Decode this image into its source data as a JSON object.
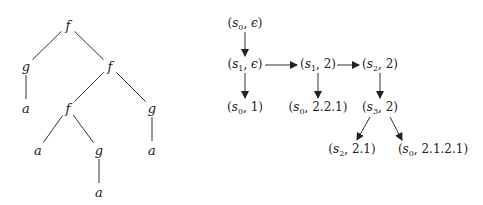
{
  "tree": {
    "nodes": [
      {
        "id": "n0",
        "label": "f",
        "x": 68,
        "y": 25
      },
      {
        "id": "n1",
        "label": "g",
        "x": 26,
        "y": 66
      },
      {
        "id": "n2",
        "label": "f",
        "x": 110,
        "y": 66
      },
      {
        "id": "n3",
        "label": "a",
        "x": 26,
        "y": 108
      },
      {
        "id": "n4",
        "label": "f",
        "x": 68,
        "y": 108
      },
      {
        "id": "n5",
        "label": "g",
        "x": 152,
        "y": 108
      },
      {
        "id": "n6",
        "label": "a",
        "x": 38,
        "y": 150
      },
      {
        "id": "n7",
        "label": "g",
        "x": 99,
        "y": 150
      },
      {
        "id": "n8",
        "label": "a",
        "x": 152,
        "y": 150
      },
      {
        "id": "n9",
        "label": "a",
        "x": 99,
        "y": 192
      }
    ],
    "edges": [
      [
        "n0",
        "n1"
      ],
      [
        "n0",
        "n2"
      ],
      [
        "n1",
        "n3"
      ],
      [
        "n2",
        "n4"
      ],
      [
        "n2",
        "n5"
      ],
      [
        "n4",
        "n6"
      ],
      [
        "n4",
        "n7"
      ],
      [
        "n5",
        "n8"
      ],
      [
        "n7",
        "n9"
      ]
    ]
  },
  "run_graph": {
    "nodes": [
      {
        "id": "r0",
        "state": "s",
        "sub": "0",
        "pos": "ϵ",
        "x": 245,
        "y": 24
      },
      {
        "id": "r1",
        "state": "s",
        "sub": "1",
        "pos": "ϵ",
        "x": 245,
        "y": 65
      },
      {
        "id": "r2",
        "state": "s",
        "sub": "0",
        "pos": "1",
        "x": 245,
        "y": 108
      },
      {
        "id": "r3",
        "state": "s",
        "sub": "1",
        "pos": "2",
        "x": 318,
        "y": 65
      },
      {
        "id": "r4",
        "state": "s",
        "sub": "0",
        "pos": "2.2.1",
        "x": 318,
        "y": 108
      },
      {
        "id": "r5",
        "state": "s",
        "sub": "2",
        "pos": "2",
        "x": 380,
        "y": 65
      },
      {
        "id": "r6",
        "state": "s",
        "sub": "3",
        "pos": "2",
        "x": 380,
        "y": 108
      },
      {
        "id": "r7",
        "state": "s",
        "sub": "2",
        "pos": "2.1",
        "x": 352,
        "y": 150
      },
      {
        "id": "r8",
        "state": "s",
        "sub": "0",
        "pos": "2.1.2.1",
        "x": 433,
        "y": 150
      }
    ],
    "edges": [
      {
        "from": [
          245,
          32
        ],
        "to": [
          245,
          56
        ]
      },
      {
        "from": [
          245,
          73
        ],
        "to": [
          245,
          98
        ]
      },
      {
        "from": [
          265,
          65
        ],
        "to": [
          297,
          65
        ]
      },
      {
        "from": [
          318,
          73
        ],
        "to": [
          318,
          98
        ]
      },
      {
        "from": [
          337,
          65
        ],
        "to": [
          359,
          65
        ]
      },
      {
        "from": [
          380,
          73
        ],
        "to": [
          380,
          98
        ]
      },
      {
        "from": [
          370,
          117
        ],
        "to": [
          357,
          140
        ]
      },
      {
        "from": [
          390,
          117
        ],
        "to": [
          402,
          140
        ]
      }
    ]
  },
  "colors": {
    "line": "#333333",
    "text": "#222222"
  }
}
